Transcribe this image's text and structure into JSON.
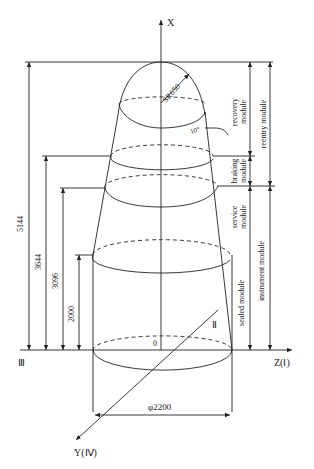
{
  "figure": {
    "type": "spacecraft coordinate system diagram",
    "axes": {
      "x_label": "X",
      "z_label": "Z(Ⅰ)",
      "y_label": "Y(Ⅳ)",
      "axis_ii_label": "Ⅱ",
      "axis_iii_label": "Ⅲ",
      "origin_label": "0"
    },
    "dimensions": {
      "total_height": "5144",
      "h_3644": "3644",
      "h_3096": "3096",
      "h_2000": "2000",
      "diameter": "φ2200",
      "nose_radius": "SR650",
      "cone_angle": "10°"
    },
    "modules": {
      "recovery": [
        "recovery",
        "module"
      ],
      "braking": [
        "braking",
        "module"
      ],
      "service": [
        "service",
        "module"
      ],
      "sealed": "sealed module",
      "reentry": "reentry module",
      "instrument": "instrument module"
    },
    "colors": {
      "line": "#222222",
      "background": "#ffffff"
    }
  }
}
